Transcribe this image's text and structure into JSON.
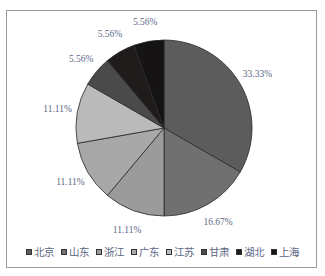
{
  "chart_data": {
    "type": "pie",
    "title": "",
    "start_angle_deg": 0,
    "direction": "clockwise",
    "categories": [
      "北京",
      "山东",
      "浙江",
      "广东",
      "江苏",
      "甘肃",
      "湖北",
      "上海"
    ],
    "values": [
      33.33,
      16.67,
      11.11,
      11.11,
      11.11,
      5.56,
      5.56,
      5.56
    ],
    "labels": [
      "33.33%",
      "16.67%",
      "11.11%",
      "11.11%",
      "11.11%",
      "5.56%",
      "5.56%",
      "5.56%"
    ],
    "colors": [
      "#5c5c5c",
      "#707070",
      "#9b9b9b",
      "#a8a8a8",
      "#bababa",
      "#4a4a4a",
      "#1f1b1b",
      "#151313"
    ],
    "legend_position": "bottom",
    "label_color": "#5b6785"
  },
  "legend": {
    "items": [
      {
        "label": "北京",
        "color": "#5c5c5c"
      },
      {
        "label": "山东",
        "color": "#707070"
      },
      {
        "label": "浙江",
        "color": "#9b9b9b"
      },
      {
        "label": "广东",
        "color": "#a8a8a8"
      },
      {
        "label": "江苏",
        "color": "#bababa"
      },
      {
        "label": "甘肃",
        "color": "#4a4a4a"
      },
      {
        "label": "湖北",
        "color": "#1f1b1b"
      },
      {
        "label": "上海",
        "color": "#151313"
      }
    ]
  }
}
